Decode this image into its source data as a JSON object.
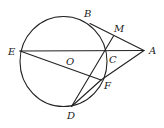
{
  "diagram": {
    "type": "geometry",
    "circle": {
      "center_label": "O",
      "cx": 63.5,
      "cy": 61.5,
      "rx": 43.5,
      "ry": 45
    },
    "points": {
      "A": {
        "label": "A",
        "x": 144,
        "y": 50.5,
        "lx": 149,
        "ly": 54
      },
      "B": {
        "label": "B",
        "x": 90,
        "y": 23.5,
        "lx": 84,
        "ly": 17
      },
      "M": {
        "label": "M",
        "x": 113.5,
        "y": 36,
        "lx": 114,
        "ly": 32
      },
      "E": {
        "label": "E",
        "x": 20,
        "y": 51,
        "lx": 8,
        "ly": 55
      },
      "O": {
        "label": "O",
        "lx": 66,
        "ly": 65
      },
      "C": {
        "label": "C",
        "x": 106.5,
        "y": 51,
        "lx": 109,
        "ly": 63
      },
      "F": {
        "label": "F",
        "x": 101,
        "y": 80,
        "lx": 104,
        "ly": 89
      },
      "D": {
        "label": "D",
        "x": 71.5,
        "y": 106.5,
        "lx": 67,
        "ly": 119
      }
    },
    "segments": [
      [
        "E",
        "A"
      ],
      [
        "B",
        "A"
      ],
      [
        "E",
        "F"
      ],
      [
        "D",
        "M"
      ],
      [
        "D",
        "F"
      ],
      [
        "F",
        "A"
      ]
    ],
    "colors": {
      "stroke": "#222222",
      "background": "#ffffff"
    }
  }
}
